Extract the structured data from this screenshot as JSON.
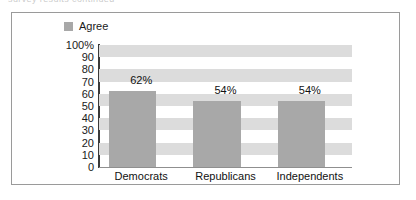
{
  "page": {
    "clipped_header_text": "survey results continued"
  },
  "chart_data": {
    "type": "bar",
    "title": "",
    "xlabel": "",
    "ylabel": "",
    "categories": [
      "Democrats",
      "Republicans",
      "Independents"
    ],
    "values": [
      62,
      54,
      54
    ],
    "value_labels": [
      "62%",
      "54%",
      "54%"
    ],
    "series": [
      {
        "name": "Agree",
        "values": [
          62,
          54,
          54
        ]
      }
    ],
    "legend": {
      "position": "top-left",
      "entries": [
        {
          "label": "Agree",
          "color": "#a8a8a8"
        }
      ]
    },
    "ylim": [
      0,
      100
    ],
    "ytick_step": 10,
    "ytick_labels": [
      "100%",
      "90",
      "80",
      "70",
      "60",
      "50",
      "40",
      "30",
      "20",
      "10",
      "0"
    ],
    "ytick_values": [
      100,
      90,
      80,
      70,
      60,
      50,
      40,
      30,
      20,
      10,
      0
    ],
    "grid": "alternating-horizontal-bands",
    "band_color": "#dcdcdc",
    "plot_background": "#ffffff",
    "bar_color": "#a8a8a8",
    "axis_color": "#3a3a3a",
    "frame_color": "#9a9a9a"
  }
}
